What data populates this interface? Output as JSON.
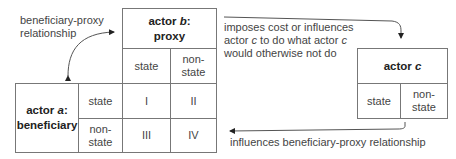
{
  "actor_b": {
    "title_prefix": "actor ",
    "title_var": "b",
    "title_suffix": ":",
    "role": "proxy",
    "columns": [
      "state",
      "non-state"
    ]
  },
  "actor_a": {
    "title_prefix": "actor ",
    "title_var": "a",
    "title_suffix": ":",
    "role": "beneficiary",
    "rows": [
      "state",
      "non-",
      "state"
    ]
  },
  "actor_c": {
    "title_prefix": "actor ",
    "title_var": "c",
    "columns": [
      "state",
      "non-state"
    ]
  },
  "matrix": {
    "cells": [
      "I",
      "II",
      "III",
      "IV"
    ]
  },
  "labels": {
    "beneficiary_proxy_line1": "beneficiary-proxy",
    "beneficiary_proxy_line2": "relationship",
    "imposes_line1": "imposes cost or influences",
    "imposes_line2_a": "actor ",
    "imposes_line2_var": "c",
    "imposes_line2_b": " to do what actor ",
    "imposes_line2_var2": "c",
    "imposes_line3": "would otherwise not do",
    "influences": "influences beneficiary-proxy relationship"
  },
  "colors": {
    "line": "#777777",
    "text": "#444444",
    "arrow": "#222222"
  }
}
